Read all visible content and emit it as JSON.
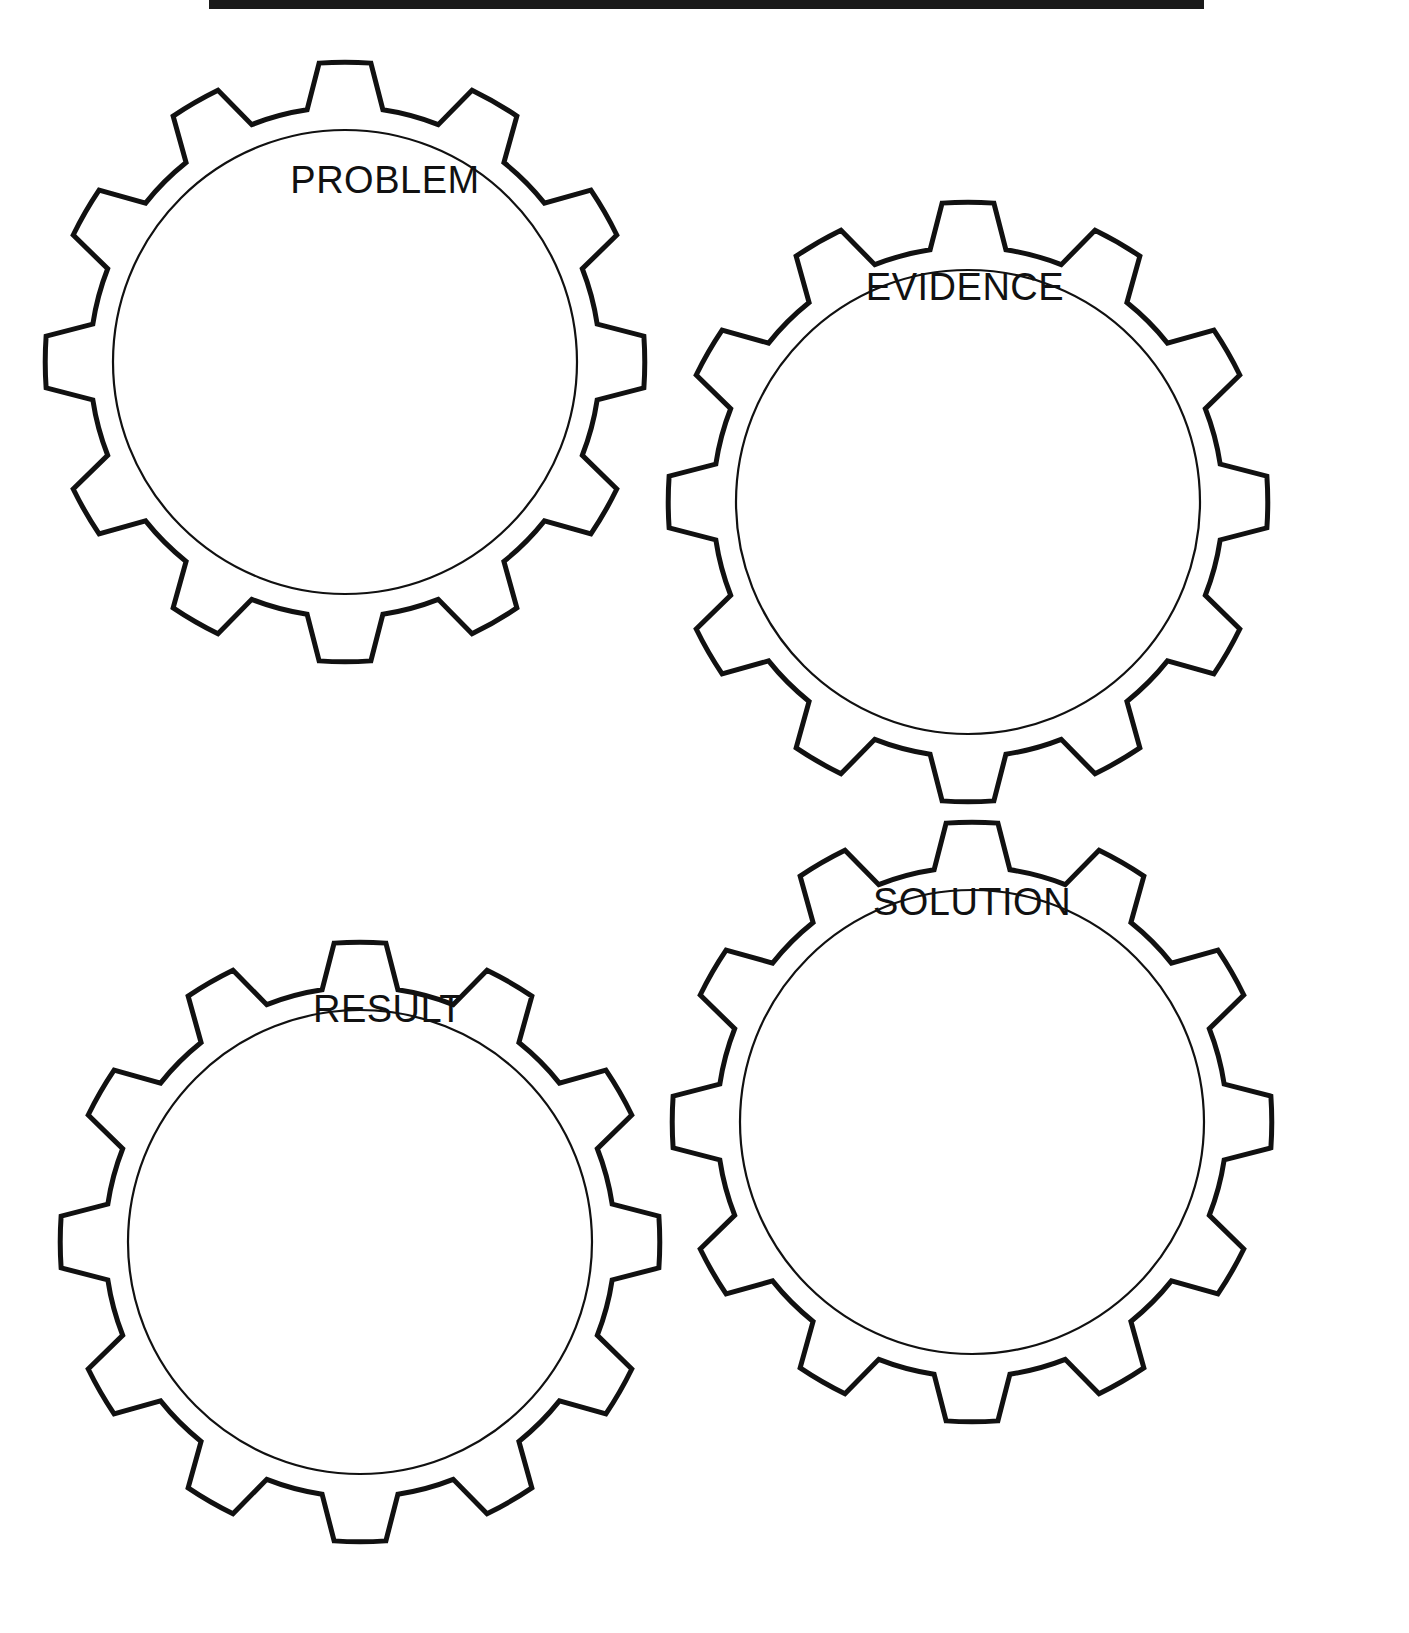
{
  "worksheet": {
    "title_rule": "",
    "background_color": "#ffffff",
    "line_color": "#111111"
  },
  "gears": [
    {
      "id": "problem",
      "label": "PROBLEM",
      "cx": 345,
      "cy": 362,
      "outer_radius": 300,
      "root_radius": 255,
      "inner_radius": 232,
      "teeth": 12,
      "rotation": 0,
      "label_x": 385,
      "label_y": 193
    },
    {
      "id": "evidence",
      "label": "EVIDENCE",
      "cx": 968,
      "cy": 502,
      "outer_radius": 300,
      "root_radius": 255,
      "inner_radius": 232,
      "teeth": 12,
      "rotation": 0,
      "label_x": 965,
      "label_y": 300
    },
    {
      "id": "result",
      "label": "RESULT",
      "cx": 360,
      "cy": 1242,
      "outer_radius": 300,
      "root_radius": 255,
      "inner_radius": 232,
      "teeth": 12,
      "rotation": 0,
      "label_x": 388,
      "label_y": 1022
    },
    {
      "id": "solution",
      "label": "SOLUTION",
      "cx": 972,
      "cy": 1122,
      "outer_radius": 300,
      "root_radius": 255,
      "inner_radius": 232,
      "teeth": 12,
      "rotation": 0,
      "label_x": 972,
      "label_y": 915
    }
  ]
}
